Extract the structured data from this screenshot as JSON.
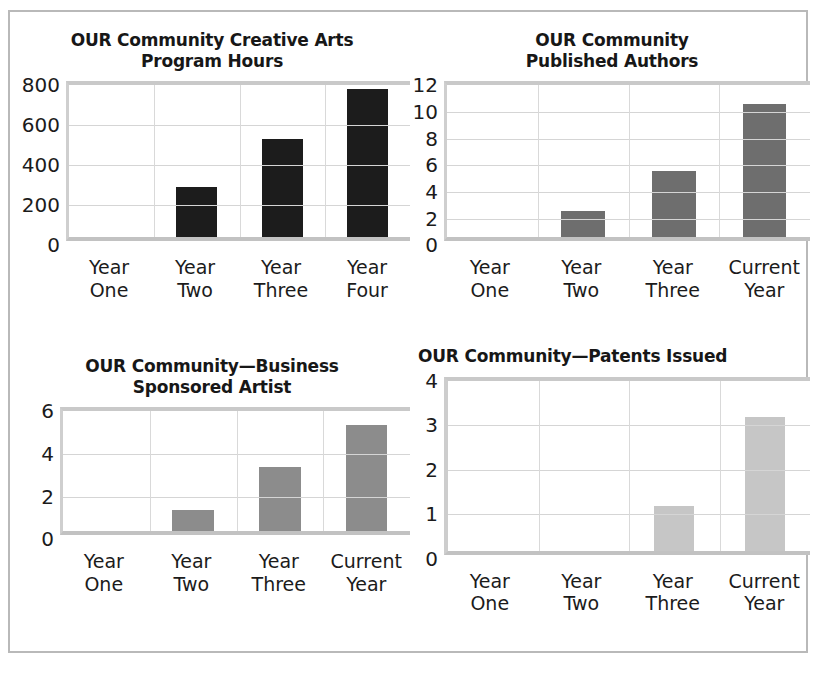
{
  "page": {
    "border_color": "#b9b9b9",
    "background": "#ffffff"
  },
  "charts": [
    {
      "id": "creative-arts-program-hours",
      "title": "OUR Community Creative Arts\nProgram Hours",
      "bar_color": "#1c1c1c",
      "chart_data": {
        "type": "bar",
        "title": "OUR Community Creative Arts Program Hours",
        "categories": [
          "Year\nOne",
          "Year\nTwo",
          "Year\nThree",
          "Year\nFour"
        ],
        "values": [
          0,
          250,
          490,
          740
        ],
        "xlabel": "",
        "ylabel": "",
        "ylim": [
          0,
          800
        ],
        "yticks": [
          0,
          200,
          400,
          600,
          800
        ],
        "ytick_labels": [
          "0",
          "200",
          "400",
          "600",
          "800"
        ],
        "grid": true,
        "legend": "none"
      }
    },
    {
      "id": "published-authors",
      "title": "OUR Community\nPublished Authors",
      "bar_color": "#6e6e6e",
      "chart_data": {
        "type": "bar",
        "title": "OUR Community Published Authors",
        "categories": [
          "Year\nOne",
          "Year\nTwo",
          "Year\nThree",
          "Current\nYear"
        ],
        "values": [
          0,
          2,
          5,
          10
        ],
        "xlabel": "",
        "ylabel": "",
        "ylim": [
          0,
          12
        ],
        "yticks": [
          0,
          2,
          4,
          6,
          8,
          10,
          12
        ],
        "ytick_labels": [
          "0",
          "2",
          "4",
          "6",
          "8",
          "10",
          "12"
        ],
        "grid": true,
        "legend": "none"
      }
    },
    {
      "id": "business-sponsored-artist",
      "title": "OUR Community—Business\nSponsored Artist",
      "bar_color": "#8c8c8c",
      "chart_data": {
        "type": "bar",
        "title": "OUR Community—Business Sponsored Artist",
        "categories": [
          "Year\nOne",
          "Year\nTwo",
          "Year\nThree",
          "Current\nYear"
        ],
        "values": [
          0,
          1,
          3,
          5
        ],
        "xlabel": "",
        "ylabel": "",
        "ylim": [
          0,
          6
        ],
        "yticks": [
          0,
          2,
          4,
          6
        ],
        "ytick_labels": [
          "0",
          "2",
          "4",
          "6"
        ],
        "grid": true,
        "legend": "none"
      }
    },
    {
      "id": "patents-issued",
      "title": "OUR Community—Patents Issued",
      "bar_color": "#c6c6c6",
      "chart_data": {
        "type": "bar",
        "title": "OUR Community—Patents Issued",
        "categories": [
          "Year\nOne",
          "Year\nTwo",
          "Year\nThree",
          "Current\nYear"
        ],
        "values": [
          0,
          0,
          1,
          3
        ],
        "xlabel": "",
        "ylabel": "",
        "ylim": [
          0,
          4
        ],
        "yticks": [
          0,
          1,
          2,
          3,
          4
        ],
        "ytick_labels": [
          "0",
          "1",
          "2",
          "3",
          "4"
        ],
        "grid": true,
        "legend": "none"
      }
    }
  ]
}
